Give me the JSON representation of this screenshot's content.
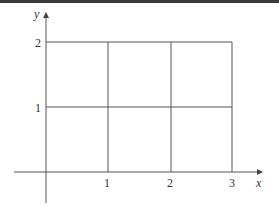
{
  "diagram": {
    "type": "coordinate-grid",
    "axes": {
      "x_label": "x",
      "y_label": "y"
    },
    "x_ticks": [
      "1",
      "2",
      "3"
    ],
    "y_ticks": [
      "1",
      "2"
    ],
    "grid": {
      "x_range": [
        0,
        3
      ],
      "y_range": [
        0,
        2
      ],
      "cells": "3x2 unit squares"
    },
    "colors": {
      "line": "#555555",
      "text": "#333333",
      "top_bar": "#3a3a3a"
    }
  }
}
